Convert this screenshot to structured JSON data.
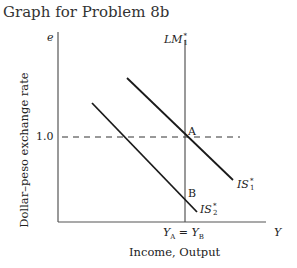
{
  "title": "Graph for Problem 8b",
  "axes": {
    "y_symbol": "e",
    "y_label": "Dollar–peso exchange rate",
    "x_symbol": "Y",
    "x_label": "Income, Output",
    "y_tick": "1.0",
    "x_tick": "YA = YB",
    "x_tick_parts": {
      "y1": "Y",
      "s1": "A",
      "eq": " = ",
      "y2": "Y",
      "s2": "B"
    }
  },
  "curves": {
    "lm": {
      "name": "LM",
      "sup": "*",
      "sub": "1"
    },
    "is1": {
      "name": "IS",
      "sup": "*",
      "sub": "1"
    },
    "is2": {
      "name": "IS",
      "sup": "*",
      "sub": "2"
    }
  },
  "points": {
    "a": "A",
    "b": "B"
  },
  "colors": {
    "line": "#1a1a1a",
    "axis": "#555555"
  }
}
